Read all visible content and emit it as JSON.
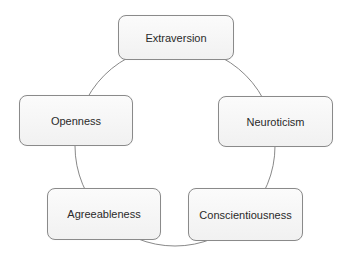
{
  "diagram": {
    "type": "cycle",
    "connector": {
      "shape": "circle",
      "color": "#7a7a7a"
    },
    "nodes": [
      {
        "label": "Extraversion"
      },
      {
        "label": "Neuroticism"
      },
      {
        "label": "Conscientiousness"
      },
      {
        "label": "Agreeableness"
      },
      {
        "label": "Openness"
      }
    ]
  }
}
